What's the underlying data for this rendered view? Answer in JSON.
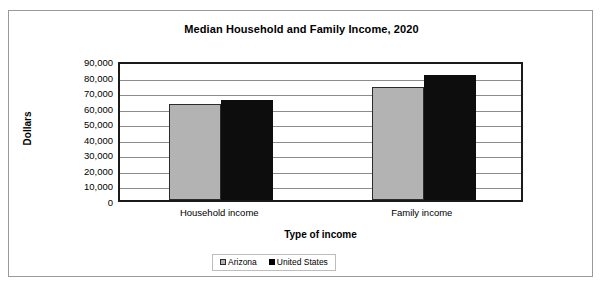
{
  "chart_data": {
    "type": "bar",
    "title": "Median Household and Family Income, 2020",
    "xlabel": "Type of income",
    "ylabel": "Dollars",
    "categories": [
      "Household income",
      "Family income"
    ],
    "series": [
      {
        "name": "Arizona",
        "color": "#b3b3b3",
        "values": [
          61500,
          72500
        ]
      },
      {
        "name": "United States",
        "color": "#000000",
        "values": [
          64000,
          80500
        ]
      }
    ],
    "ylim": [
      0,
      90000
    ],
    "ytick_labels": [
      "90,000",
      "80,000",
      "70,000",
      "60,000",
      "50,000",
      "40,000",
      "30,000",
      "20,000",
      "10,000",
      "0"
    ],
    "ytick_values": [
      90000,
      80000,
      70000,
      60000,
      50000,
      40000,
      30000,
      20000,
      10000,
      0
    ],
    "grid": true,
    "legend_position": "bottom"
  }
}
